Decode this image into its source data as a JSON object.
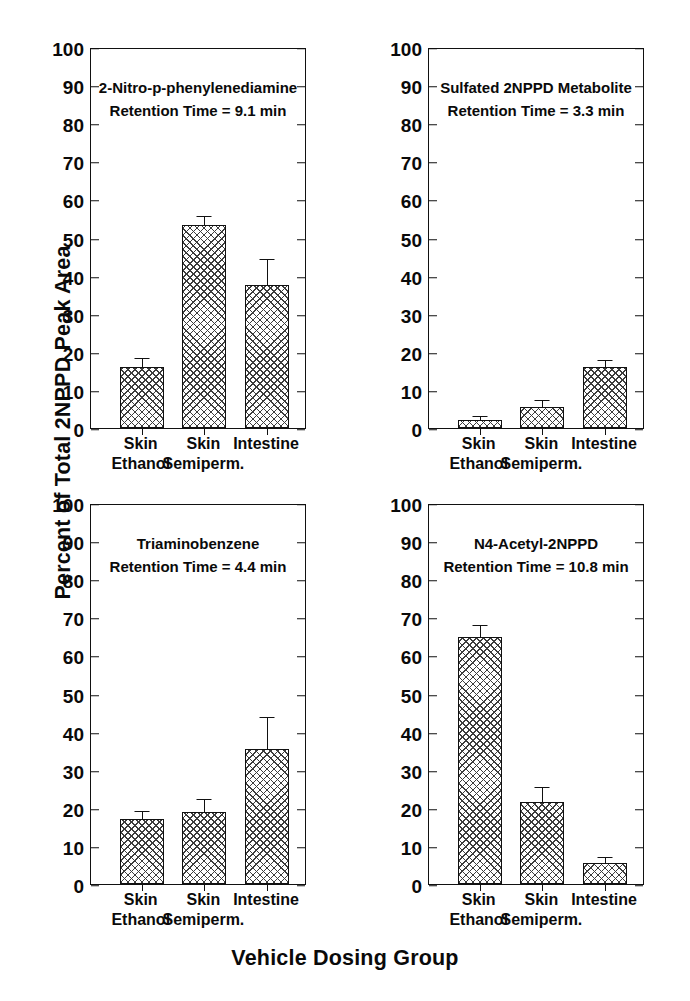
{
  "axes": {
    "y_title": "Percent of Total 2NPPD Peak Area",
    "x_title": "Vehicle Dosing Group",
    "y_ticks": [
      0,
      10,
      20,
      30,
      40,
      50,
      60,
      70,
      80,
      90,
      100
    ],
    "categories": [
      "Skin\nEthanol",
      "Skin\nSemiperm.",
      "Intestine"
    ],
    "category_line1": [
      "Skin",
      "Skin",
      "Intestine"
    ],
    "category_line2": [
      "Ethanol",
      "Semiperm.",
      ""
    ]
  },
  "chart_data": [
    {
      "type": "bar",
      "panel": "top-left",
      "title": "2-Nitro-p-phenylenediamine",
      "subtitle": "Retention Time = 9.1 min",
      "categories": [
        "Skin Ethanol",
        "Skin Semiperm.",
        "Intestine"
      ],
      "values": [
        16.0,
        53.2,
        37.5
      ],
      "errors": [
        2.0,
        2.2,
        6.5
      ],
      "xlabel": "",
      "ylabel": "Percent of Total 2NPPD Peak Area",
      "ylim": [
        0,
        100
      ],
      "yticks": [
        0,
        10,
        20,
        30,
        40,
        50,
        60,
        70,
        80,
        90,
        100
      ],
      "grid": false,
      "legend": "none"
    },
    {
      "type": "bar",
      "panel": "top-right",
      "title": "Sulfated 2NPPD Metabolite",
      "subtitle": "Retention Time = 3.3 min",
      "categories": [
        "Skin Ethanol",
        "Skin Semiperm.",
        "Intestine"
      ],
      "values": [
        2.0,
        5.4,
        16.0
      ],
      "errors": [
        0.8,
        1.8,
        1.6
      ],
      "xlabel": "",
      "ylabel": "Percent of Total 2NPPD Peak Area",
      "ylim": [
        0,
        100
      ],
      "yticks": [
        0,
        10,
        20,
        30,
        40,
        50,
        60,
        70,
        80,
        90,
        100
      ],
      "grid": false,
      "legend": "none"
    },
    {
      "type": "bar",
      "panel": "bottom-left",
      "title": "Triaminobenzene",
      "subtitle": "Retention Time = 4.4 min",
      "categories": [
        "Skin Ethanol",
        "Skin Semiperm.",
        "Intestine"
      ],
      "values": [
        17.0,
        19.0,
        35.5
      ],
      "errors": [
        1.8,
        3.0,
        8.0
      ],
      "xlabel": "",
      "ylabel": "Percent of Total 2NPPD Peak Area",
      "ylim": [
        0,
        100
      ],
      "yticks": [
        0,
        10,
        20,
        30,
        40,
        50,
        60,
        70,
        80,
        90,
        100
      ],
      "grid": false,
      "legend": "none"
    },
    {
      "type": "bar",
      "panel": "bottom-right",
      "title": "N4-Acetyl-2NPPD",
      "subtitle": "Retention Time = 10.8 min",
      "categories": [
        "Skin Ethanol",
        "Skin Semiperm.",
        "Intestine"
      ],
      "values": [
        64.8,
        21.5,
        5.5
      ],
      "errors": [
        2.8,
        3.8,
        1.2
      ],
      "xlabel": "",
      "ylabel": "Percent of Total 2NPPD Peak Area",
      "ylim": [
        0,
        100
      ],
      "yticks": [
        0,
        10,
        20,
        30,
        40,
        50,
        60,
        70,
        80,
        90,
        100
      ],
      "grid": false,
      "legend": "none"
    }
  ]
}
